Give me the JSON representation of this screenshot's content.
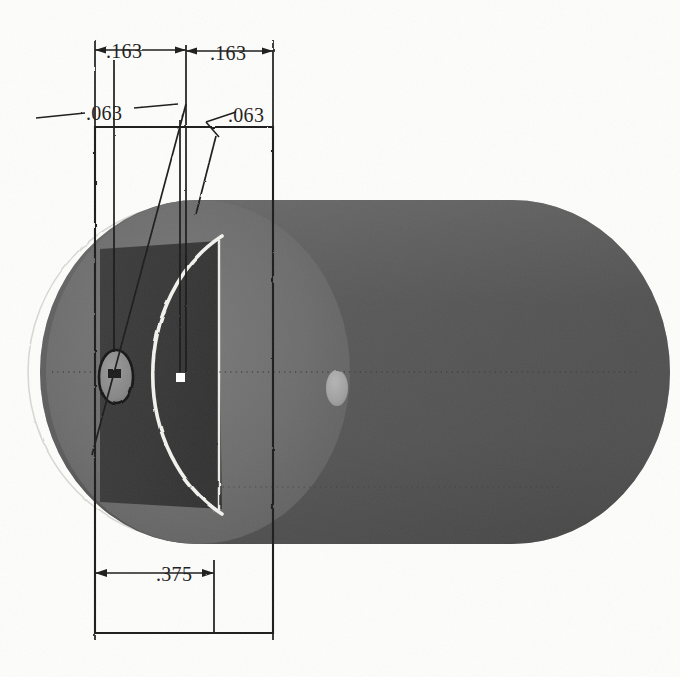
{
  "drawing": {
    "title": "Dimensioned cylindrical part with cross-hole",
    "background_color": "#fdfdfb",
    "line_color": "#1c1c1c",
    "units_note": "inches (decimal)",
    "dimensions": [
      {
        "id": "dim-163-left",
        "label": ".163",
        "x": 124,
        "y": 55,
        "orientation": "horizontal",
        "role": "offset from left edge to hole center"
      },
      {
        "id": "dim-163-right",
        "label": ".163",
        "x": 228,
        "y": 57,
        "orientation": "horizontal",
        "role": "offset from hole center to right edge"
      },
      {
        "id": "dim-063-left",
        "label": ".063",
        "x": 106,
        "y": 114,
        "orientation": "leader",
        "role": "hole diameter callout"
      },
      {
        "id": "dim-063-right",
        "label": ".063",
        "x": 248,
        "y": 117,
        "orientation": "leader",
        "role": "feature width callout"
      },
      {
        "id": "dim-375",
        "label": ".375",
        "x": 176,
        "y": 575,
        "orientation": "horizontal",
        "role": "overall width of part"
      }
    ],
    "solid": {
      "left_disc_color": "#6e6e6e",
      "front_face_color": "#3a3a3a",
      "body_color": "#5a5a5a",
      "body_shadow_color": "#4a4a4a",
      "highlight_color": "#f0f0ec",
      "hole_outline_color": "#1c1c1c",
      "hole_fill_color": "#8c8c8c",
      "far_hole_fill_color": "#a6a6a6",
      "centerline_color": "#2a2a2a",
      "construction_arc_color": "#d2d2ce"
    },
    "outline_rect": {
      "x": 95,
      "y": 127,
      "width": 178,
      "height": 506,
      "stroke": "#1c1c1c",
      "fill": "none"
    },
    "markers": {
      "square_marker_color": "#ffffff",
      "square_marker_x": 180,
      "square_marker_y": 377
    }
  }
}
